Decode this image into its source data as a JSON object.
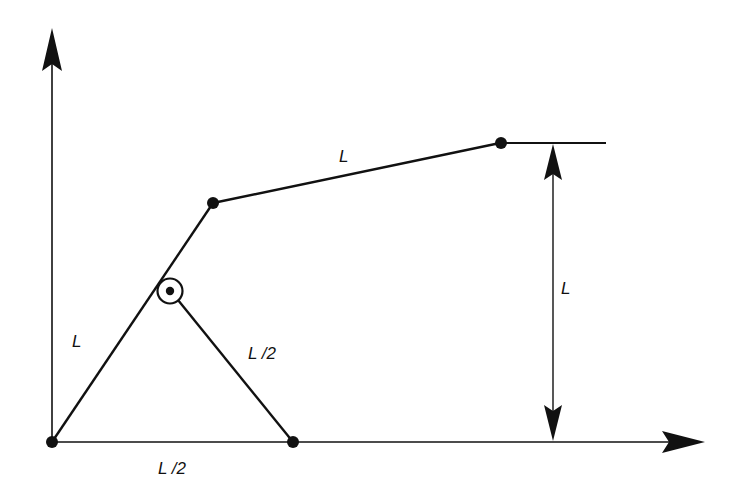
{
  "diagram": {
    "type": "linkage-mechanism",
    "colors": {
      "stroke": "#111111",
      "background": "#ffffff"
    },
    "axes": {
      "y_axis": {
        "x": 52,
        "y_start": 442,
        "y_end": 30
      },
      "x_axis": {
        "y": 442,
        "x_start": 52,
        "x_end": 705
      }
    },
    "points": {
      "origin": {
        "x": 52,
        "y": 442
      },
      "elbow": {
        "x": 213,
        "y": 203
      },
      "pivot": {
        "x": 170,
        "y": 291
      },
      "ground_joint": {
        "x": 293,
        "y": 442
      },
      "end_effector": {
        "x": 500,
        "y": 143
      }
    },
    "links": [
      {
        "name": "link-lower",
        "from": "origin",
        "to": "elbow",
        "length_label": "L"
      },
      {
        "name": "link-upper",
        "from": "elbow",
        "to": "end_effector",
        "length_label": "L"
      },
      {
        "name": "link-support",
        "from": "pivot",
        "to": "ground_joint",
        "length_label": "L /2"
      }
    ],
    "labels": {
      "upper_link": "L",
      "height_dimension": "L",
      "lower_link": "L",
      "support_link": "L /2",
      "base_distance": "L /2"
    },
    "dimensions": {
      "vertical_height": {
        "x": 553,
        "y_top": 143,
        "y_bottom": 442,
        "label": "L"
      },
      "reference_line": {
        "y": 143,
        "x_start": 500,
        "x_end": 606
      }
    }
  }
}
